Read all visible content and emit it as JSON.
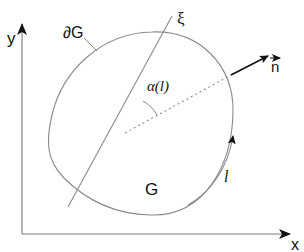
{
  "diagram": {
    "title": "",
    "axes": {
      "x_label": "x",
      "y_label": "y"
    },
    "labels": {
      "boundary": "∂G",
      "region": "G",
      "xi_axis": "ξ",
      "angle": "α(l)",
      "normal": "n",
      "arc_length": "l"
    },
    "colors": {
      "line": "#8a8a8a",
      "axis": "#7a7a7a",
      "arrow": "#111111",
      "text": "#111111",
      "background": "#ffffff"
    },
    "elements": [
      {
        "id": "x-axis",
        "type": "arrow",
        "from": [
          22,
          234
        ],
        "to": [
          292,
          234
        ]
      },
      {
        "id": "y-axis",
        "type": "arrow",
        "from": [
          22,
          234
        ],
        "to": [
          22,
          22
        ]
      },
      {
        "id": "boundary-curve",
        "type": "closed-curve",
        "label": "∂G"
      },
      {
        "id": "xi-line",
        "type": "line",
        "from": [
          68,
          207
        ],
        "to": [
          172,
          16
        ],
        "label": "ξ"
      },
      {
        "id": "radius",
        "type": "dotted-line",
        "from": [
          125,
          133
        ],
        "to": [
          231,
          75
        ]
      },
      {
        "id": "normal-vector",
        "type": "arrow",
        "from": [
          231,
          75
        ],
        "to": [
          272,
          55
        ],
        "label": "n"
      },
      {
        "id": "angle-arc",
        "type": "arc",
        "label": "α(l)"
      },
      {
        "id": "direction-arc",
        "type": "arrow-arc",
        "label": "l"
      }
    ]
  }
}
